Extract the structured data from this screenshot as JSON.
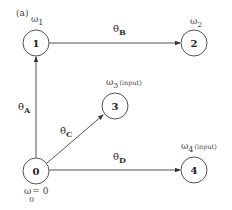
{
  "diagram": {
    "panel_label": "(a)",
    "colors": {
      "stroke": "#555555",
      "text": "#333333",
      "background": "#ffffff"
    },
    "nodes": [
      {
        "id": "0",
        "label": "0",
        "omega_symbol": "ω",
        "omega_sub": "0",
        "omega_eq": "= 0",
        "input": ""
      },
      {
        "id": "1",
        "label": "1",
        "omega_symbol": "ω",
        "omega_sub": "1",
        "input": ""
      },
      {
        "id": "2",
        "label": "2",
        "omega_symbol": "ω",
        "omega_sub": "2",
        "input": ""
      },
      {
        "id": "3",
        "label": "3",
        "omega_symbol": "ω",
        "omega_sub": "3",
        "input": "(input)"
      },
      {
        "id": "4",
        "label": "4",
        "omega_symbol": "ω",
        "omega_sub": "4",
        "input": "(input)"
      }
    ],
    "edges": [
      {
        "from": "0",
        "to": "1",
        "symbol": "θ̇",
        "sub": "A"
      },
      {
        "from": "1",
        "to": "2",
        "symbol": "θ̇",
        "sub": "B"
      },
      {
        "from": "0",
        "to": "3",
        "symbol": "θ̇",
        "sub": "C"
      },
      {
        "from": "0",
        "to": "4",
        "symbol": "θ̇",
        "sub": "D"
      }
    ]
  }
}
